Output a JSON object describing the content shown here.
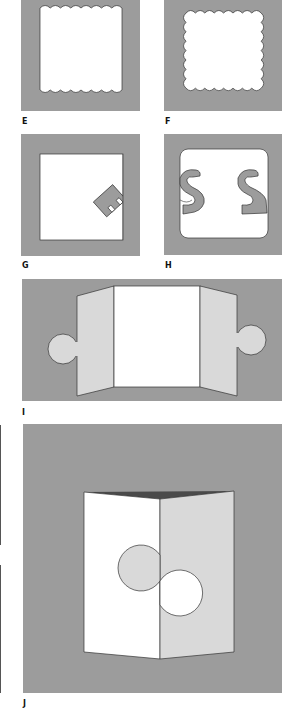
{
  "figure": {
    "colors": {
      "background_gray": "#9c9c9c",
      "light_gray": "#d9d9d9",
      "white": "#ffffff",
      "outline": "#333333",
      "dark_fold": "#4a4a4a"
    },
    "panels": [
      {
        "id": "E",
        "label": "E",
        "description": "Square window with scalloped top and bottom edges"
      },
      {
        "id": "F",
        "label": "F",
        "description": "Square window with scalloped edges on all four sides"
      },
      {
        "id": "G",
        "label": "G",
        "description": "Square window with a tilted letter E shape protruding from the right edge"
      },
      {
        "id": "H",
        "label": "H",
        "description": "Rounded square window with letter S shapes on left and right edges"
      },
      {
        "id": "I",
        "label": "I",
        "description": "Gatefold card with two side flaps ending in circular tabs"
      },
      {
        "id": "J",
        "label": "J",
        "description": "Folded card with interlocking circular puzzle cut across the fold"
      }
    ]
  }
}
